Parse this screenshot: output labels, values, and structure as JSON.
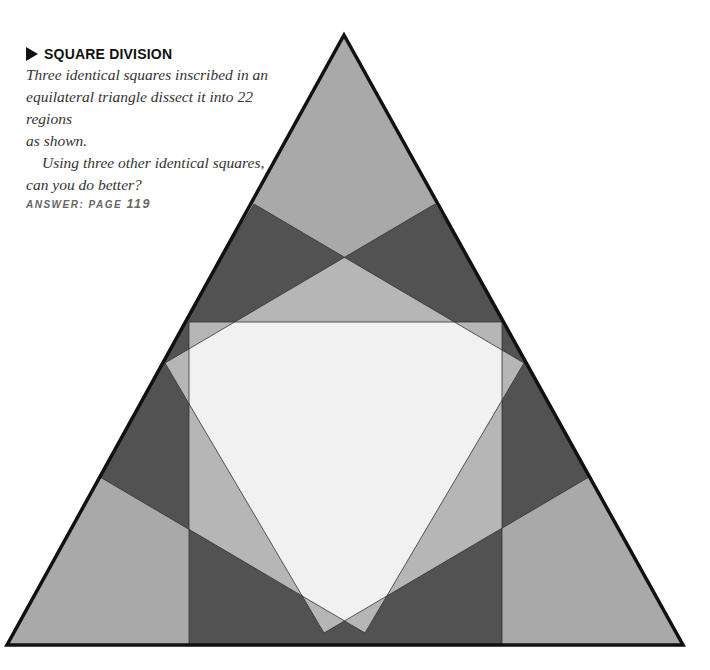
{
  "puzzle": {
    "title": "SQUARE DIVISION",
    "marker_icon": "right-triangle-arrow",
    "body": [
      "Three identical squares inscribed in an",
      "equilateral triangle dissect it into 22 regions",
      "as shown.",
      "Using three other identical squares,",
      "can you do better?"
    ],
    "answer_label": "Answer:",
    "answer_page_label": "page",
    "answer_page_number": "119",
    "region_count": 22
  },
  "figure": {
    "shape": "equilateral triangle with three inscribed identical squares",
    "colors": {
      "outline": "#111111",
      "uncovered": "#a9a9a9",
      "one_square": "#525252",
      "two_squares": "#b6b6b6",
      "three_squares": "#f1f1f1"
    }
  }
}
